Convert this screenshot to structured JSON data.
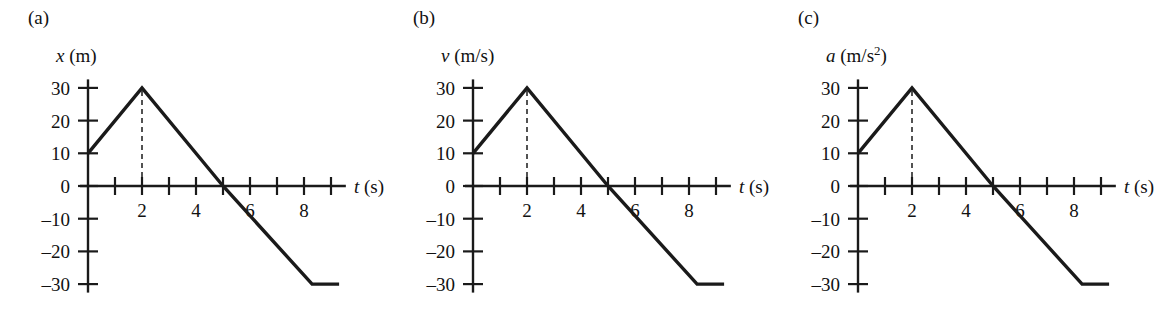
{
  "figure": {
    "background": "#ffffff",
    "ink_color": "#1a1a1a"
  },
  "panels": [
    {
      "key": "a",
      "panel_label": "(a)",
      "axis_title_var": "x",
      "axis_title_unit": "(m)",
      "axis_title_sup": "",
      "axis_title_full": "x (m)",
      "x_axis_label_var": "t",
      "x_axis_label_unit": "(s)"
    },
    {
      "key": "b",
      "panel_label": "(b)",
      "axis_title_var": "v",
      "axis_title_unit": "(m/s)",
      "axis_title_sup": "",
      "axis_title_full": "v (m/s)",
      "x_axis_label_var": "t",
      "x_axis_label_unit": "(s)"
    },
    {
      "key": "c",
      "panel_label": "(c)",
      "axis_title_var": "a",
      "axis_title_unit": "(m/s",
      "axis_title_sup": "2",
      "axis_title_full": "a (m/s2)",
      "x_axis_label_var": "t",
      "x_axis_label_unit": "(s)"
    }
  ],
  "chart_data": [
    {
      "type": "line",
      "panel": "(a)",
      "title": "x (m)",
      "xlabel": "t (s)",
      "ylabel": "x (m)",
      "xlim": [
        0,
        9.3
      ],
      "ylim": [
        -30,
        30
      ],
      "grid": false,
      "legend": "none",
      "x_ticks": [
        1,
        2,
        3,
        4,
        5,
        6,
        7,
        8,
        9
      ],
      "x_tick_labels": [
        "",
        "2",
        "",
        "4",
        "",
        "6",
        "",
        "8",
        ""
      ],
      "y_ticks": [
        30,
        20,
        10,
        0,
        -10,
        -20,
        -30
      ],
      "y_tick_labels": [
        "30",
        "20",
        "10",
        "0",
        "–10",
        "–20",
        "–30"
      ],
      "series": [
        {
          "name": "x",
          "x": [
            0,
            2,
            5,
            8.3,
            9.3
          ],
          "y": [
            10,
            30,
            0,
            -30,
            -30
          ]
        }
      ],
      "annotations": [
        {
          "type": "dashed-vertical",
          "x": 2,
          "y_from": 0,
          "y_to": 30
        }
      ]
    },
    {
      "type": "line",
      "panel": "(b)",
      "title": "v (m/s)",
      "xlabel": "t (s)",
      "ylabel": "v (m/s)",
      "xlim": [
        0,
        9.3
      ],
      "ylim": [
        -30,
        30
      ],
      "grid": false,
      "legend": "none",
      "x_ticks": [
        1,
        2,
        3,
        4,
        5,
        6,
        7,
        8,
        9
      ],
      "x_tick_labels": [
        "",
        "2",
        "",
        "4",
        "",
        "6",
        "",
        "8",
        ""
      ],
      "y_ticks": [
        30,
        20,
        10,
        0,
        -10,
        -20,
        -30
      ],
      "y_tick_labels": [
        "30",
        "20",
        "10",
        "0",
        "–10",
        "–20",
        "–30"
      ],
      "series": [
        {
          "name": "v",
          "x": [
            0,
            2,
            5,
            8.3,
            9.3
          ],
          "y": [
            10,
            30,
            0,
            -30,
            -30
          ]
        }
      ],
      "annotations": [
        {
          "type": "dashed-vertical",
          "x": 2,
          "y_from": 0,
          "y_to": 30
        }
      ]
    },
    {
      "type": "line",
      "panel": "(c)",
      "title": "a (m/s2)",
      "xlabel": "t (s)",
      "ylabel": "a (m/s2)",
      "xlim": [
        0,
        9.3
      ],
      "ylim": [
        -30,
        30
      ],
      "grid": false,
      "legend": "none",
      "x_ticks": [
        1,
        2,
        3,
        4,
        5,
        6,
        7,
        8,
        9
      ],
      "x_tick_labels": [
        "",
        "2",
        "",
        "4",
        "",
        "6",
        "",
        "8",
        ""
      ],
      "y_ticks": [
        30,
        20,
        10,
        0,
        -10,
        -20,
        -30
      ],
      "y_tick_labels": [
        "30",
        "20",
        "10",
        "0",
        "–10",
        "–20",
        "–30"
      ],
      "series": [
        {
          "name": "a",
          "x": [
            0,
            2,
            5,
            8.3,
            9.3
          ],
          "y": [
            10,
            30,
            0,
            -30,
            -30
          ]
        }
      ],
      "annotations": [
        {
          "type": "dashed-vertical",
          "x": 2,
          "y_from": 0,
          "y_to": 30
        }
      ]
    }
  ]
}
